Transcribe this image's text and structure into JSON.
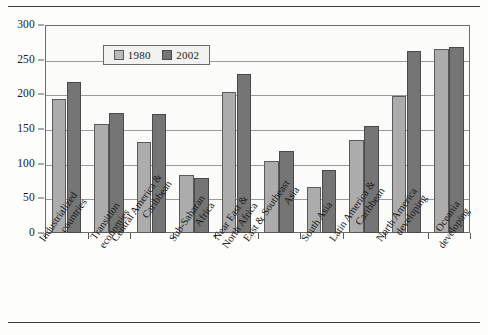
{
  "figure": {
    "background_color": "#fdfdfc",
    "has_top_rule": true,
    "has_bottom_rule": true
  },
  "legend": {
    "position": "top-center-inside",
    "entries": [
      {
        "label": "1980",
        "color": "#b9b9b9",
        "swatch_name": "legend-swatch-1980"
      },
      {
        "label": "2002",
        "color": "#757575",
        "swatch_name": "legend-swatch-2002"
      }
    ]
  },
  "axes": {
    "y_ticks": [
      "0",
      "50",
      "100",
      "150",
      "200",
      "250",
      "300"
    ],
    "x_tick_count": 11
  },
  "chart_data": {
    "type": "bar",
    "title": "",
    "subtitle": "",
    "xlabel": "",
    "ylabel": "",
    "ylim": [
      0,
      300
    ],
    "ytick_step": 50,
    "grid": true,
    "legend_position": "upper center",
    "categories": [
      "Industrialized countries",
      "Transition economies",
      "Central America & Caribbean",
      "Sub-Saharan Africa",
      "Near East & North Africa",
      "East & Southeast Asia",
      "South Asia",
      "Latin America & Caribbean",
      "North America developing",
      "Oceania developing"
    ],
    "category_lines": [
      [
        "Industrialized",
        "countries"
      ],
      [
        "Transition",
        "economies"
      ],
      [
        "Central America &",
        "Caribbean"
      ],
      [
        "Sub-Saharan",
        "Africa"
      ],
      [
        "Near East &",
        "North Africa"
      ],
      [
        "East & Southeast",
        "Asia"
      ],
      [
        "South Asia",
        ""
      ],
      [
        "Latin America &",
        "Caribbean"
      ],
      [
        "North America",
        "developing"
      ],
      [
        "Oceania",
        "developing"
      ]
    ],
    "series": [
      {
        "name": "1980",
        "color": "#acacac",
        "values": [
          194,
          157,
          131,
          84,
          204,
          104,
          67,
          134,
          197,
          265
        ]
      },
      {
        "name": "2002",
        "color": "#757575",
        "values": [
          218,
          173,
          171,
          79,
          229,
          118,
          91,
          154,
          263,
          268
        ]
      }
    ]
  }
}
